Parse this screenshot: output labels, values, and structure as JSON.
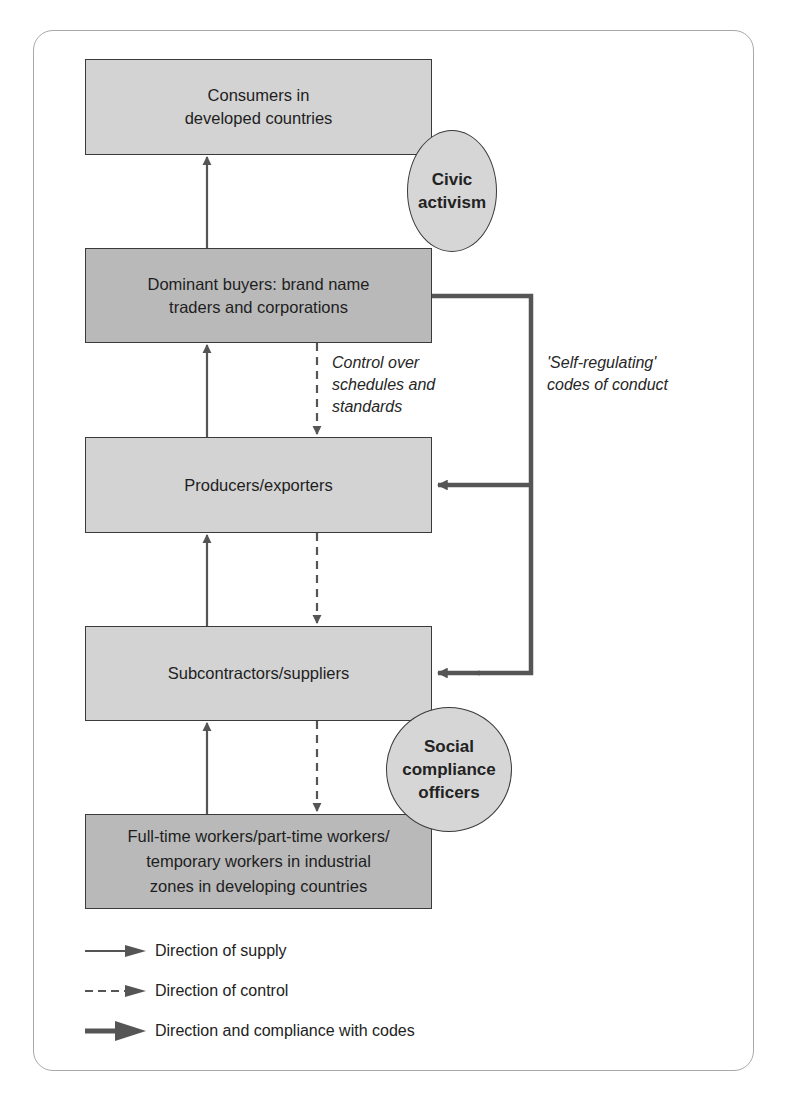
{
  "diagram": {
    "type": "supply-chain flow diagram",
    "nodes": [
      {
        "id": "consumers",
        "label": "Consumers in\ndeveloped countries",
        "shade": "light"
      },
      {
        "id": "dominant_buyers",
        "label": "Dominant buyers: brand name\ntraders and corporations",
        "shade": "dark"
      },
      {
        "id": "producers",
        "label": "Producers/exporters",
        "shade": "light"
      },
      {
        "id": "subcontractors",
        "label": "Subcontractors/suppliers",
        "shade": "light"
      },
      {
        "id": "workers",
        "label": "Full-time workers/part-time workers/\ntemporary workers in industrial\nzones in developing countries",
        "shade": "dark"
      }
    ],
    "circles": [
      {
        "id": "civic_activism",
        "label": "Civic\nactivism"
      },
      {
        "id": "social_compliance",
        "label": "Social\ncompliance\nofficers"
      }
    ],
    "annotations": {
      "control": "Control over\nschedules and\nstandards",
      "self_regulating": "'Self-regulating'\ncodes of  conduct"
    },
    "edges": [
      {
        "from": "dominant_buyers",
        "to": "consumers",
        "kind": "supply"
      },
      {
        "from": "producers",
        "to": "dominant_buyers",
        "kind": "supply"
      },
      {
        "from": "subcontractors",
        "to": "producers",
        "kind": "supply"
      },
      {
        "from": "workers",
        "to": "subcontractors",
        "kind": "supply"
      },
      {
        "from": "dominant_buyers",
        "to": "producers",
        "kind": "control"
      },
      {
        "from": "producers",
        "to": "subcontractors",
        "kind": "control"
      },
      {
        "from": "subcontractors",
        "to": "workers",
        "kind": "control"
      },
      {
        "from": "dominant_buyers",
        "to": "producers",
        "kind": "codes"
      },
      {
        "from": "dominant_buyers",
        "to": "subcontractors",
        "kind": "codes"
      }
    ]
  },
  "legend": [
    {
      "kind": "supply",
      "label": "Direction of supply"
    },
    {
      "kind": "control",
      "label": "Direction of control"
    },
    {
      "kind": "codes",
      "label": "Direction and compliance with codes"
    }
  ],
  "colors": {
    "arrow": "#555555",
    "box_light": "#d3d3d3",
    "box_dark": "#b9b9b9",
    "circle": "#d6d6d6",
    "frame": "#a8a8a8"
  }
}
